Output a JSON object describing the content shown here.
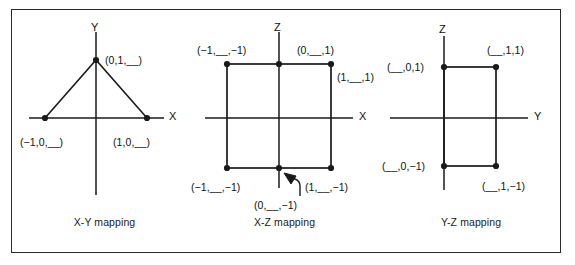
{
  "figure": {
    "width": 575,
    "height": 265,
    "line_color": "#1a1a1a",
    "text_color": "#111111",
    "background": "#ffffff"
  },
  "panels": [
    {
      "id": "xy",
      "caption": "X-Y mapping",
      "axes": {
        "horizontal": "X",
        "vertical": "Y"
      },
      "shape": "triangle",
      "points": [
        {
          "name": "apex",
          "label": "(0,1,__)",
          "x": 0,
          "y": 1
        },
        {
          "name": "left-base",
          "label": "(−1,0,__)",
          "x": -1,
          "y": 0
        },
        {
          "name": "right-base",
          "label": "(1,0,__)",
          "x": 1,
          "y": 0
        }
      ]
    },
    {
      "id": "xz",
      "caption": "X-Z mapping",
      "axes": {
        "horizontal": "X",
        "vertical": "Z"
      },
      "shape": "square",
      "points": [
        {
          "name": "top-left",
          "label": "(−1,__,−1)",
          "x": -1,
          "z": 1
        },
        {
          "name": "top-center",
          "label": "(0,__,1)",
          "x": 0,
          "z": 1
        },
        {
          "name": "top-right",
          "label": "(1,__,1)",
          "x": 1,
          "z": 1
        },
        {
          "name": "bottom-left",
          "label": "(−1,__,−1)",
          "x": -1,
          "z": -1
        },
        {
          "name": "bottom-center",
          "label": "(0,__,−1)",
          "x": 0,
          "z": -1
        },
        {
          "name": "bottom-right",
          "label": "(1,__,−1)",
          "x": 1,
          "z": -1
        }
      ],
      "annotation": {
        "name": "arrow-to-bottom-center",
        "target": "bottom-center"
      }
    },
    {
      "id": "yz",
      "caption": "Y-Z mapping",
      "axes": {
        "horizontal": "Y",
        "vertical": "Z"
      },
      "shape": "rectangle",
      "points": [
        {
          "name": "top-left",
          "label": "(__,0,1)",
          "y": 0,
          "z": 1
        },
        {
          "name": "top-right",
          "label": "(__,1,1)",
          "y": 1,
          "z": 1
        },
        {
          "name": "bottom-left",
          "label": "(__,0,−1)",
          "y": 0,
          "z": -1
        },
        {
          "name": "bottom-right",
          "label": "(__,1,−1)",
          "y": 1,
          "z": -1
        }
      ]
    }
  ]
}
